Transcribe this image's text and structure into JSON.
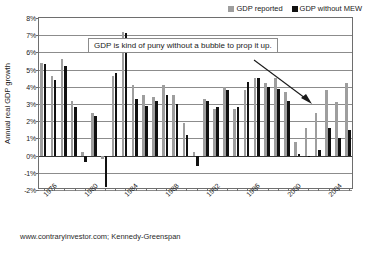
{
  "chart_data": {
    "type": "bar",
    "title": "",
    "xlabel": "",
    "ylabel": "Annual real GDP growth",
    "ylim": [
      -2,
      8
    ],
    "ytick_labels": [
      "8%",
      "7%",
      "6%",
      "5%",
      "4%",
      "3%",
      "2%",
      "1%",
      "0%",
      "-1%",
      "-2%"
    ],
    "ytick_values": [
      8,
      7,
      6,
      5,
      4,
      3,
      2,
      1,
      0,
      -1,
      -2
    ],
    "grid": true,
    "legend_position": "top-right",
    "categories": [
      "1976",
      "1977",
      "1978",
      "1979",
      "1980",
      "1981",
      "1982",
      "1983",
      "1984",
      "1985",
      "1986",
      "1987",
      "1988",
      "1989",
      "1990",
      "1991",
      "1992",
      "1993",
      "1994",
      "1995",
      "1996",
      "1997",
      "1998",
      "1999",
      "2000",
      "2001",
      "2002",
      "2003",
      "2004",
      "2005",
      "2006"
    ],
    "xtick_labels": [
      "1976",
      "1980",
      "1984",
      "1988",
      "1992",
      "1996",
      "2000",
      "2004"
    ],
    "xtick_categories": [
      "1976",
      "1980",
      "1984",
      "1988",
      "1992",
      "1996",
      "2000",
      "2004"
    ],
    "series": [
      {
        "name": "GDP reported",
        "color": "#9e9e9e",
        "values": [
          5.4,
          4.6,
          5.6,
          3.2,
          0.2,
          2.5,
          -0.2,
          4.6,
          7.2,
          4.1,
          3.5,
          3.4,
          4.1,
          3.5,
          1.9,
          0.2,
          3.3,
          2.7,
          4.0,
          2.7,
          3.8,
          4.5,
          4.2,
          4.5,
          3.7,
          0.8,
          1.6,
          2.5,
          3.8,
          3.1,
          4.2
        ]
      },
      {
        "name": "GDP without MEW",
        "color": "#111111",
        "values": [
          5.3,
          4.4,
          5.2,
          2.8,
          -0.4,
          2.3,
          -1.8,
          4.8,
          7.1,
          3.3,
          2.9,
          3.2,
          3.5,
          3.0,
          1.2,
          -0.6,
          3.2,
          2.8,
          3.8,
          2.8,
          4.3,
          4.5,
          4.0,
          3.9,
          3.2,
          0.1,
          0.0,
          0.3,
          1.6,
          1.0,
          1.5
        ]
      }
    ],
    "annotation": "GDP is kind of puny without a bubble to prop it up."
  },
  "legend": {
    "items": [
      {
        "label": "GDP reported",
        "swatch": "reported"
      },
      {
        "label": "GDP without MEW",
        "swatch": "nomew"
      }
    ]
  },
  "source": {
    "text": "www.contraryinvestor.com; Kennedy-Greenspan"
  }
}
